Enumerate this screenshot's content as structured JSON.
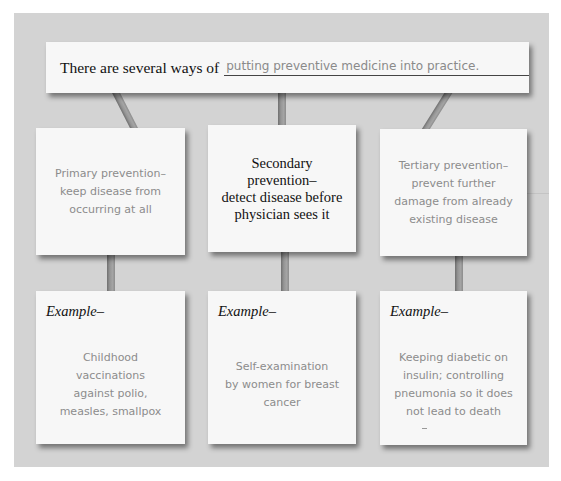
{
  "title": {
    "lead": "There are several ways of",
    "fill": "putting preventive medicine into practice."
  },
  "levels": [
    {
      "name": "primary",
      "lines": [
        "Primary prevention–",
        "keep disease from",
        "occurring at all"
      ],
      "style": "handwritten",
      "example_label": "Example–",
      "example_lines": [
        "Childhood",
        "vaccinations",
        "against polio,",
        "measles, smallpox"
      ]
    },
    {
      "name": "secondary",
      "lines": [
        "Secondary",
        "prevention–",
        "detect disease before",
        "physician sees it"
      ],
      "style": "printed",
      "example_label": "Example–",
      "example_lines": [
        "Self-examination",
        "by women for breast",
        "cancer"
      ]
    },
    {
      "name": "tertiary",
      "lines": [
        "Tertiary prevention–",
        "prevent further",
        "damage from already",
        "existing disease"
      ],
      "style": "handwritten",
      "example_label": "Example–",
      "example_lines": [
        "Keeping diabetic on",
        "insulin; controlling",
        "pneumonia so it does",
        "not lead to death"
      ]
    }
  ],
  "colors": {
    "panel": "#d3d3d3",
    "card": "#f7f7f7",
    "connector": "#959595",
    "handwriting": "#8c8c8c",
    "print": "#111111"
  }
}
